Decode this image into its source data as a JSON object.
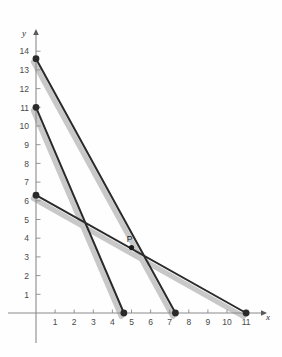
{
  "figure": {
    "background_color": "#fefefe",
    "width": 282,
    "height": 357
  },
  "chart_data": {
    "type": "line",
    "title": "",
    "xlabel": "x",
    "ylabel": "y",
    "xlim": [
      0,
      12
    ],
    "ylim": [
      0,
      15
    ],
    "grid": false,
    "legend": null,
    "axis": {
      "x_ticks": [
        1,
        2,
        3,
        4,
        5,
        6,
        7,
        8,
        9,
        10,
        11
      ],
      "y_ticks": [
        1,
        2,
        3,
        4,
        5,
        6,
        7,
        8,
        9,
        10,
        11,
        12,
        13,
        14
      ],
      "x_tick_labels": [
        "1",
        "2",
        "3",
        "4",
        "5",
        "6",
        "7",
        "8",
        "9",
        "10",
        "11"
      ],
      "y_tick_labels": [
        "1",
        "2",
        "3",
        "4",
        "5",
        "6",
        "7",
        "8",
        "9",
        "10",
        "11",
        "12",
        "13",
        "14"
      ],
      "x_axis_label": "x",
      "y_axis_label": "y",
      "arrow_heads": true,
      "axis_color": "#808080"
    },
    "series": [
      {
        "name": "line-a",
        "points": [
          [
            0,
            13.6
          ],
          [
            7.3,
            0
          ]
        ],
        "color": "#2a2a2a",
        "shadow_color": "#c8c8c8",
        "markers": [
          [
            0,
            13.6
          ],
          [
            7.3,
            0
          ]
        ]
      },
      {
        "name": "line-b",
        "points": [
          [
            0,
            11.0
          ],
          [
            4.6,
            0
          ]
        ],
        "color": "#2a2a2a",
        "shadow_color": "#c8c8c8",
        "markers": [
          [
            0,
            11.0
          ],
          [
            4.6,
            0
          ]
        ]
      },
      {
        "name": "line-c",
        "points": [
          [
            0,
            6.3
          ],
          [
            11.0,
            0
          ]
        ],
        "color": "#2a2a2a",
        "shadow_color": "#c8c8c8",
        "markers": [
          [
            0,
            6.3
          ],
          [
            11.0,
            0
          ]
        ]
      }
    ],
    "annotations": [
      {
        "name": "point-p",
        "label": "P",
        "x": 5.0,
        "y": 3.5,
        "marker": true
      }
    ]
  }
}
